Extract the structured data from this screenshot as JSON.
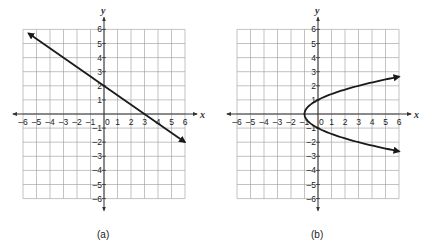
{
  "chart_data": [
    {
      "type": "line",
      "panel": "a",
      "caption": "(a)",
      "xlabel": "x",
      "ylabel": "y",
      "xlim": [
        -6,
        6
      ],
      "ylim": [
        -6,
        6
      ],
      "xticks": [
        "-6",
        "-5",
        "-4",
        "-3",
        "-2",
        "-1",
        "0",
        "1",
        "2",
        "3",
        "4",
        "5",
        "6"
      ],
      "yticks": [
        "6",
        "5",
        "4",
        "3",
        "2",
        "1",
        "-1",
        "-2",
        "-3",
        "-4",
        "-5",
        "-6"
      ],
      "grid": true,
      "series": [
        {
          "name": "line",
          "equation": "y = -2/3 x + 2",
          "points": [
            [
              -5.6,
              5.73
            ],
            [
              0,
              2
            ],
            [
              3,
              0
            ],
            [
              6,
              -2
            ]
          ],
          "arrows": "both"
        }
      ]
    },
    {
      "type": "line",
      "panel": "b",
      "caption": "(b)",
      "xlabel": "x",
      "ylabel": "y",
      "xlim": [
        -6,
        6
      ],
      "ylim": [
        -6,
        6
      ],
      "xticks": [
        "-6",
        "-5",
        "-4",
        "-3",
        "-2",
        "-1",
        "0",
        "1",
        "2",
        "3",
        "4",
        "5",
        "6"
      ],
      "yticks": [
        "6",
        "5",
        "4",
        "3",
        "2",
        "1",
        "-1",
        "-2",
        "-3",
        "-4",
        "-5",
        "-6"
      ],
      "grid": true,
      "series": [
        {
          "name": "parabola",
          "equation": "x = y^2 - 1",
          "points": [
            [
              6,
              2.65
            ],
            [
              3,
              2
            ],
            [
              0,
              1
            ],
            [
              -1,
              0
            ],
            [
              0,
              -1
            ],
            [
              3,
              -2
            ],
            [
              6,
              -2.65
            ]
          ],
          "arrows": "both"
        }
      ]
    }
  ],
  "labels": {
    "panel_a": "(a)",
    "panel_b": "(b)",
    "x_axis": "x",
    "y_axis": "y"
  },
  "colors": {
    "grid": "#9a9a9a",
    "axis": "#333333",
    "curve": "#1a1a1a"
  }
}
